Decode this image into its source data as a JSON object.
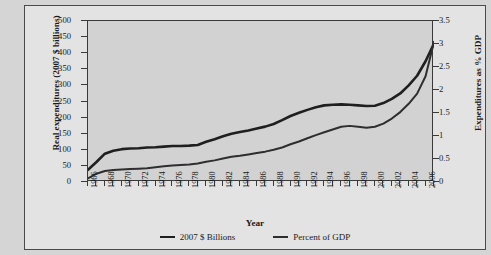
{
  "page": {
    "background_color": "#d5d5d5",
    "figure_background": "#e3e3e3",
    "plot_background": "#d2d2d2",
    "line_color": "#1f1f1f"
  },
  "margin_caption_fragments": [
    {
      "text": "ing"
    },
    {
      "text": "are"
    },
    {
      "text": "h"
    },
    {
      "text": "of"
    },
    {
      "text": "t."
    }
  ],
  "legend": {
    "items": [
      {
        "label": "2007 $ Billions",
        "color": "#1f1f1f"
      },
      {
        "label": "Percent of GDP",
        "color": "#2e2e2e"
      }
    ]
  },
  "chart_data": {
    "type": "line",
    "title": "",
    "xlabel": "Year",
    "ylabel": "Real expenditures (2007 $ billions)",
    "y2label": "Expenditures as % GDP",
    "xlim": [
      1966,
      2007
    ],
    "ylim": [
      0,
      500
    ],
    "y2lim": [
      0,
      3.5
    ],
    "yticks": [
      0,
      50,
      100,
      150,
      200,
      250,
      300,
      350,
      400,
      450,
      500
    ],
    "y2ticks": [
      "0",
      "0.5",
      "1",
      "1.5",
      "2",
      "2.5",
      "3",
      "3.5"
    ],
    "grid": false,
    "legend_position": "bottom",
    "x": [
      1966,
      1967,
      1968,
      1969,
      1970,
      1971,
      1972,
      1973,
      1974,
      1975,
      1976,
      1977,
      1978,
      1979,
      1980,
      1981,
      1982,
      1983,
      1984,
      1985,
      1986,
      1987,
      1988,
      1989,
      1990,
      1991,
      1992,
      1993,
      1994,
      1995,
      1996,
      1997,
      1998,
      1999,
      2000,
      2001,
      2002,
      2003,
      2004,
      2005,
      2006,
      2007
    ],
    "xtick_labels": [
      1966,
      1968,
      1970,
      1972,
      1974,
      1976,
      1978,
      1980,
      1982,
      1984,
      1986,
      1988,
      1990,
      1992,
      1994,
      1996,
      1998,
      2000,
      2002,
      2004,
      2006
    ],
    "series": [
      {
        "name": "2007 $ Billions",
        "axis": "left",
        "color": "#1f1f1f",
        "values": [
          38,
          62,
          88,
          97,
          102,
          104,
          105,
          107,
          108,
          110,
          112,
          112,
          113,
          115,
          125,
          133,
          142,
          150,
          155,
          160,
          166,
          172,
          180,
          192,
          205,
          215,
          224,
          232,
          238,
          240,
          241,
          240,
          238,
          236,
          237,
          245,
          258,
          275,
          300,
          330,
          375,
          430
        ]
      },
      {
        "name": "Percent of GDP",
        "axis": "right",
        "color": "#2e2e2e",
        "values": [
          0.08,
          0.18,
          0.24,
          0.26,
          0.27,
          0.28,
          0.29,
          0.3,
          0.32,
          0.34,
          0.36,
          0.37,
          0.38,
          0.4,
          0.44,
          0.47,
          0.51,
          0.55,
          0.57,
          0.6,
          0.63,
          0.66,
          0.7,
          0.75,
          0.82,
          0.88,
          0.95,
          1.02,
          1.08,
          1.14,
          1.2,
          1.22,
          1.2,
          1.18,
          1.2,
          1.27,
          1.38,
          1.52,
          1.7,
          1.92,
          2.3,
          3.05
        ]
      }
    ]
  }
}
